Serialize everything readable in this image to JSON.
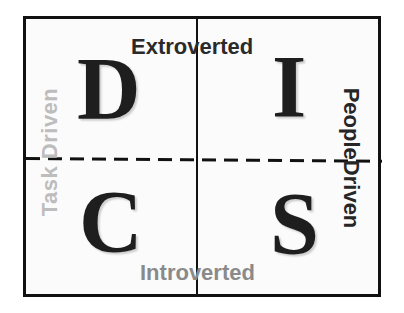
{
  "diagram": {
    "quadrants": [
      {
        "position": "top-left",
        "letter": "D"
      },
      {
        "position": "top-right",
        "letter": "I"
      },
      {
        "position": "bottom-left",
        "letter": "C"
      },
      {
        "position": "bottom-right",
        "letter": "S"
      }
    ],
    "axes": {
      "top": "Extroverted",
      "bottom": "Introverted",
      "left": "Task Driven",
      "right": "PeopleDriven"
    },
    "colors": {
      "border": "#111111",
      "letters": "#1e1e1e",
      "extroverted": "#2a2a2a",
      "introverted": "#8a8a8a",
      "task_driven": "#bdbdbd",
      "people_driven": "#262626",
      "background": "#fbfbfb"
    }
  }
}
